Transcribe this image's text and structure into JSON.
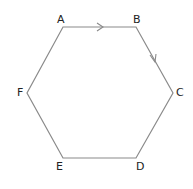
{
  "diagram": {
    "type": "hexagon",
    "stroke_color": "#8a8a8a",
    "vertices": [
      {
        "label": "A",
        "x": 63,
        "y": 27
      },
      {
        "label": "B",
        "x": 136,
        "y": 27
      },
      {
        "label": "C",
        "x": 173,
        "y": 93
      },
      {
        "label": "D",
        "x": 136,
        "y": 158
      },
      {
        "label": "E",
        "x": 63,
        "y": 158
      },
      {
        "label": "F",
        "x": 27,
        "y": 93
      }
    ],
    "arrows": [
      {
        "edge": "AB",
        "direction": "A→B"
      },
      {
        "edge": "BC",
        "direction": "B→C"
      }
    ]
  }
}
